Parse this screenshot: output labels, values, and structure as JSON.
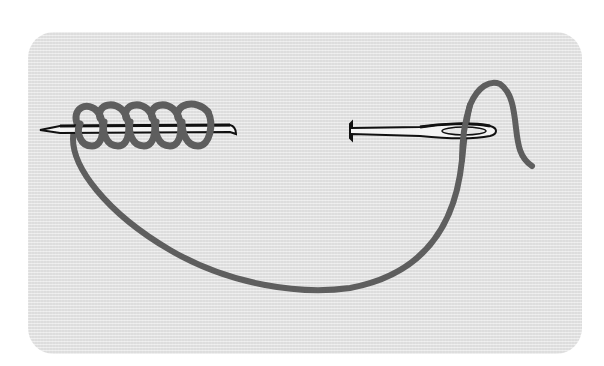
{
  "illustration": {
    "subject": "bullion-knot-stitch",
    "description": "Needle with thread wrapped in coils on the left; needle eye with thread on the right",
    "colors": {
      "background": "#ffffff",
      "panel": "#e4e4e4",
      "thread": "#5e5e5e",
      "needle_outline": "#111111",
      "needle_fill": "#f4f4f4"
    },
    "coil_count": 5
  }
}
